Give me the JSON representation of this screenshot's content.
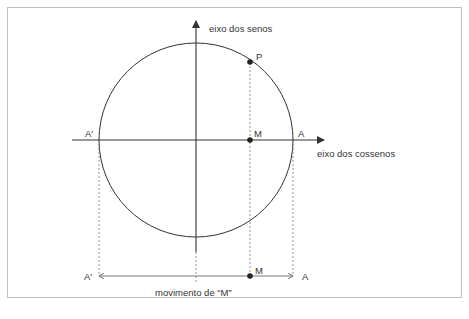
{
  "diagram": {
    "axis_sine_label": "eixo dos senos",
    "axis_cosine_label": "eixo dos cossenos",
    "point_P": "P",
    "point_M": "M",
    "point_A": "A",
    "point_A_prime": "A'",
    "bottom_M": "M",
    "bottom_A": "A",
    "bottom_A_prime": "A'",
    "movement_label": "movimento de “M”"
  },
  "colors": {
    "stroke": "#333333",
    "frame": "#bfbfbf",
    "dashed": "#777777"
  }
}
